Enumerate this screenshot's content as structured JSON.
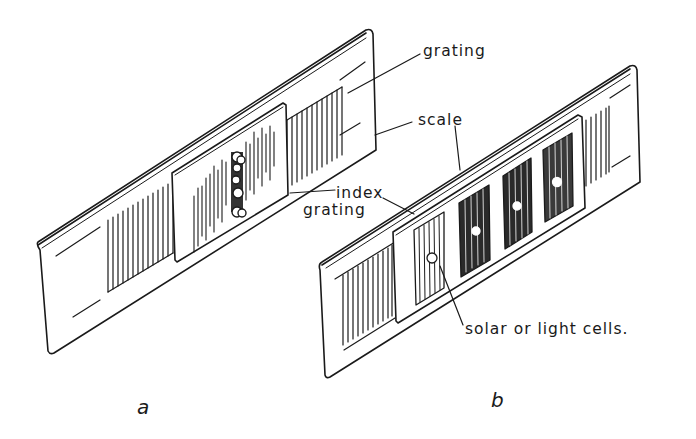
{
  "figure": {
    "panels": [
      {
        "id": "a",
        "caption": "a",
        "description": "Scale grating with index grating and cluster of light cells over moiré fringe pattern"
      },
      {
        "id": "b",
        "caption": "b",
        "description": "Scale with index grating containing four windowed gratings, each with a solar/light cell"
      }
    ],
    "labels": {
      "grating": "grating",
      "scale": "scale",
      "index_line1": "index",
      "index_line2": "grating",
      "cells": "solar or light cells."
    },
    "colors": {
      "ink": "#1a1a1a",
      "background": "#ffffff"
    }
  }
}
